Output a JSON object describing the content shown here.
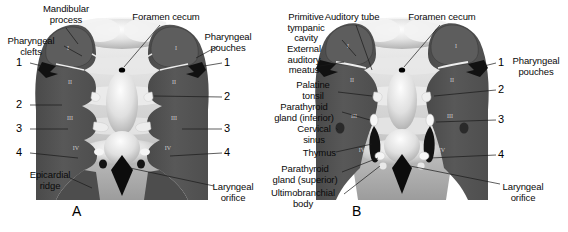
{
  "figure": {
    "background_color": "#ffffff",
    "arch_tissue_color": "#555555",
    "pharynx_color": "#d8d8d8",
    "dark_structure_color": "#151515",
    "light_structure_color": "#f2f2f2",
    "width": 568,
    "height": 232
  },
  "panels": [
    {
      "id": "A",
      "letter": "A",
      "letter_x": 72,
      "letter_y": 205,
      "labels_left": [
        {
          "name": "mandibular-process",
          "text": "Mandibular\nprocess",
          "x": 66,
          "y": 6,
          "align": "center"
        },
        {
          "name": "pharyngeal-clefts",
          "text": "Pharyngeal\nclefts",
          "x": 38,
          "y": 38,
          "align": "center"
        },
        {
          "name": "epicardial-ridge",
          "text": "Epicardial\nridge",
          "x": 48,
          "y": 172,
          "align": "center"
        }
      ],
      "labels_right": [
        {
          "name": "pharyngeal-pouches",
          "text": "Pharyngeal\npouches",
          "x": 232,
          "y": 34,
          "align": "center"
        },
        {
          "name": "laryngeal-orifice",
          "text": "Laryngeal\norifice",
          "x": 230,
          "y": 185,
          "align": "center"
        }
      ],
      "labels_top": [
        {
          "name": "foramen-cecum",
          "text": "Foramen cecum",
          "x": 160,
          "y": 16,
          "align": "center"
        }
      ],
      "numbers_left": [
        {
          "name": "cleft-1",
          "text": "1",
          "x": 18,
          "y": 63
        },
        {
          "name": "cleft-2",
          "text": "2",
          "x": 18,
          "y": 105
        },
        {
          "name": "cleft-3",
          "text": "3",
          "x": 18,
          "y": 129
        },
        {
          "name": "cleft-4",
          "text": "4",
          "x": 18,
          "y": 153
        }
      ],
      "numbers_right": [
        {
          "name": "pouch-1",
          "text": "1",
          "x": 226,
          "y": 63
        },
        {
          "name": "pouch-2",
          "text": "2",
          "x": 226,
          "y": 97
        },
        {
          "name": "pouch-3",
          "text": "3",
          "x": 226,
          "y": 129
        },
        {
          "name": "pouch-4",
          "text": "4",
          "x": 226,
          "y": 153
        }
      ],
      "arch_numerals": [
        "I",
        "II",
        "III",
        "IV"
      ]
    },
    {
      "id": "B",
      "letter": "B",
      "letter_x": 352,
      "letter_y": 205,
      "labels_left": [
        {
          "name": "primitive-tympanic-cavity",
          "text": "Primitive\ntympanic\ncavity",
          "x": 305,
          "y": 14,
          "align": "center"
        },
        {
          "name": "external-auditory-meatus",
          "text": "External\nauditory\nmeatus",
          "x": 303,
          "y": 49,
          "align": "center"
        },
        {
          "name": "palatine-tonsil",
          "text": "Palatine\ntonsil",
          "x": 312,
          "y": 85,
          "align": "center"
        },
        {
          "name": "parathyroid-gland-inferior",
          "text": "Parathyroid\ngland (inferior)",
          "x": 303,
          "y": 106,
          "align": "center"
        },
        {
          "name": "cervical-sinus",
          "text": "Cervical\nsinus",
          "x": 312,
          "y": 128,
          "align": "center"
        },
        {
          "name": "thymus",
          "text": "Thymus",
          "x": 307,
          "y": 152,
          "align": "center"
        },
        {
          "name": "parathyroid-gland-superior",
          "text": "Parathyroid\ngland (superior)",
          "x": 302,
          "y": 168,
          "align": "center"
        },
        {
          "name": "ultimobranchial-body",
          "text": "Ultimobranchial\nbody",
          "x": 302,
          "y": 192,
          "align": "center"
        }
      ],
      "labels_right": [
        {
          "name": "pharyngeal-pouches",
          "text": "Pharyngeal\npouches",
          "x": 530,
          "y": 58,
          "align": "center"
        },
        {
          "name": "laryngeal-orifice",
          "text": "Laryngeal\norifice",
          "x": 519,
          "y": 185,
          "align": "center"
        }
      ],
      "labels_top": [
        {
          "name": "auditory-tube",
          "text": "Auditory tube",
          "x": 352,
          "y": 16,
          "align": "center"
        },
        {
          "name": "foramen-cecum",
          "text": "Foramen cecum",
          "x": 440,
          "y": 16,
          "align": "center"
        }
      ],
      "numbers_right": [
        {
          "name": "pouch-1",
          "text": "1",
          "x": 500,
          "y": 63
        },
        {
          "name": "pouch-2",
          "text": "2",
          "x": 500,
          "y": 90
        },
        {
          "name": "pouch-3",
          "text": "3",
          "x": 500,
          "y": 120
        },
        {
          "name": "pouch-4",
          "text": "4",
          "x": 500,
          "y": 155
        }
      ],
      "arch_numerals": [
        "I",
        "II",
        "III",
        "IV"
      ]
    }
  ]
}
